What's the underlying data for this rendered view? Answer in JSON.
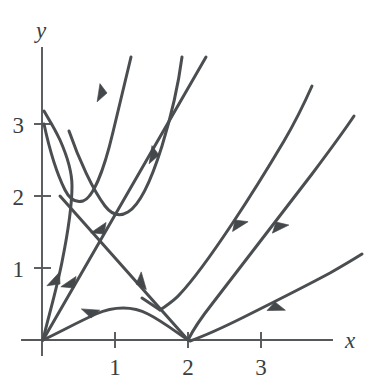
{
  "chart_data": {
    "type": "line",
    "title": "",
    "subtitle": "",
    "xlabel": "x",
    "ylabel": "y",
    "xlim": [
      -0.1,
      4.4
    ],
    "ylim": [
      -0.1,
      4.0
    ],
    "grid": false,
    "legend": null,
    "xticks": [
      {
        "value": 1,
        "label": "1",
        "px": 115
      },
      {
        "value": 2,
        "label": "2",
        "px": 188
      },
      {
        "value": 3,
        "label": "3",
        "px": 261
      }
    ],
    "yticks": [
      {
        "value": 1,
        "label": "1",
        "px": 268
      },
      {
        "value": 2,
        "label": "2",
        "px": 196
      },
      {
        "value": 3,
        "label": "3",
        "px": 124
      }
    ],
    "origin_px": {
      "x": 42,
      "y": 340
    },
    "unit_px": {
      "x": 73,
      "y": 72
    },
    "axes": {
      "x_axis_path": "M 22 340 L 332 340",
      "y_axis_path": "M 42 355 L 42 48",
      "x_label_pos": {
        "x": 352,
        "y": 348
      },
      "y_label_pos": {
        "x": 40,
        "y": 36
      }
    },
    "series": [
      {
        "name": "curve-1-from-y3",
        "description": "Starts on y-axis near (0,3), dips to minimum near (0.29,2.41), rises steeply off top of frame.",
        "path": "M 44 124 C 50 152, 58 176, 65 190 C 70 200, 76 203, 83 201 C 93 198, 104 170, 113 132 C 120 102, 126 78, 131 57",
        "arrows": [
          {
            "px": 107,
            "py": 91,
            "angle_deg": 253,
            "direction": "toward-origin"
          }
        ]
      },
      {
        "name": "curve-2-separatrix-left",
        "description": "Steep near-vertical separatrix hugging the y-axis, leaving the origin upward and bending right.",
        "path": "M 43 340 C 48 318, 56 292, 62 262 C 68 232, 72 204, 72 186 C 72 172, 68 158, 60 140 C 54 127, 48 118, 44 111",
        "arrows": [
          {
            "px": 60,
            "py": 284,
            "angle_deg": 287,
            "direction": "away-from-origin"
          }
        ]
      },
      {
        "name": "curve-3-parabola-mid",
        "description": "Descends from upper region, minimum near (0.97,1.73), rises steeply up-right off frame.",
        "path": "M 69 131 C 79 160, 93 190, 105 206 C 112 215, 120 217, 128 212 C 140 205, 152 178, 162 146 C 170 120, 177 95, 182 57",
        "arrows": [
          {
            "px": 159,
            "py": 155,
            "angle_deg": 253,
            "direction": "toward-minimum"
          }
        ]
      },
      {
        "name": "curve-4-diagonal-down",
        "description": "Straight separatrix of slope about -1 descending from upper-left through (1,1) to the axis touch point at (2,0).",
        "path": "M 60 196 L 188 340",
        "arrows": [
          {
            "px": 136,
            "py": 284,
            "angle_deg": 48,
            "direction": "toward-2-0"
          }
        ]
      },
      {
        "name": "curve-5-diagonal-up",
        "description": "Straight separatrix of slope about +1 from the origin through (1,1) continuing up-right off frame.",
        "path": "M 43 340 L 206 57",
        "arrows": [
          {
            "px": 104,
            "py": 234,
            "angle_deg": 300,
            "direction": "away-from-origin"
          },
          {
            "px": 74,
            "py": 288,
            "angle_deg": 300,
            "direction": "away-from-origin"
          }
        ]
      },
      {
        "name": "curve-6-low-hump",
        "description": "Leaves the origin almost flat, rises to a low hump near (1.35,0.42), then falls to meet the x-axis at (2,0).",
        "path": "M 43 340 C 60 332, 78 322, 96 314 C 114 306, 133 306, 148 314 C 162 321, 176 332, 188 340",
        "arrows": [
          {
            "px": 89,
            "py": 317,
            "angle_deg": 338,
            "direction": "away-from-origin"
          }
        ]
      },
      {
        "name": "curve-7-vertex-at-1p62",
        "description": "Sharp vertex near (1.62,0.47); branch descends steeply from upper-left and the other branch climbs up-right off the top of the frame.",
        "path": "M 160 310 C 167 305, 174 301, 180 294 C 196 277, 214 251, 232 224 C 250 197, 268 168, 284 141 C 294 124, 304 104, 312 86",
        "arrows": [
          {
            "px": 235,
            "py": 220,
            "angle_deg": 122,
            "direction": "toward-vertex"
          }
        ]
      },
      {
        "name": "curve-7b-vertex-lower-branch",
        "description": "Lower branch of the vertex curve, approaching the vertex from the left along the descending separatrix.",
        "path": "M 142 298 C 148 302, 154 306, 160 310",
        "arrows": []
      },
      {
        "name": "curve-8-from-2-0",
        "description": "Leaves the axis touch point at (2,0) and climbs to the upper right off the frame.",
        "path": "M 188 340 C 193 330, 201 318, 212 304 C 240 268, 278 218, 312 174 C 330 150, 344 131, 354 116",
        "arrows": [
          {
            "px": 276,
            "py": 222,
            "angle_deg": 128,
            "direction": "toward-2-0"
          }
        ]
      },
      {
        "name": "curve-9-shallow-right",
        "description": "Shallow trajectory rising from near (2,0) to the right edge, slope roughly +0.45.",
        "path": "M 190 341 C 204 336, 222 328, 244 317 C 272 303, 304 287, 330 273 C 344 265, 354 259, 362 254",
        "arrows": [
          {
            "px": 275,
            "py": 302,
            "angle_deg": 153,
            "direction": "toward-left"
          }
        ]
      }
    ]
  },
  "labels": {
    "x_axis": "x",
    "y_axis": "y",
    "x_tick_1": "1",
    "x_tick_2": "2",
    "x_tick_3": "3",
    "y_tick_1": "1",
    "y_tick_2": "2",
    "y_tick_3": "3"
  },
  "colors": {
    "background": "#ffffff",
    "curve": "#4b4e50",
    "axis": "#55585a",
    "text": "#3b3e40"
  }
}
